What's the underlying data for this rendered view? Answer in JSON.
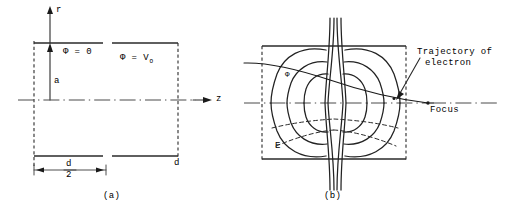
{
  "figure": {
    "caption_a": "(a)",
    "caption_b": "(b)",
    "panel_a": {
      "axis_r_label": "r",
      "axis_z_label": "z",
      "potential_left_label": "Φ = 0",
      "potential_right_label": "Φ = V",
      "potential_right_subscript": "O",
      "aperture_radius_label": "a",
      "gap_label_numerator": "d",
      "gap_label_denominator": "2",
      "total_gap_label": "d"
    },
    "panel_b": {
      "equipotential_label": "Φ",
      "field_label": "E",
      "trajectory_label_line1": "Trajectory of",
      "trajectory_label_line2": "electron",
      "focus_label": "Focus"
    }
  },
  "colors": {
    "background": "#ffffff",
    "ink": "#1a1a1a",
    "line": "#2a2a2a",
    "centerline": "#4a4a4a"
  }
}
